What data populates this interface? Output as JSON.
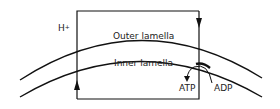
{
  "diagram": {
    "proton": {
      "base": "H",
      "charge": "+"
    },
    "outer_label": "Outer lamella",
    "inner_label": "Inner lamella",
    "atp_label": "ATP",
    "adp_label": "ADP",
    "line_color": "#111111"
  }
}
